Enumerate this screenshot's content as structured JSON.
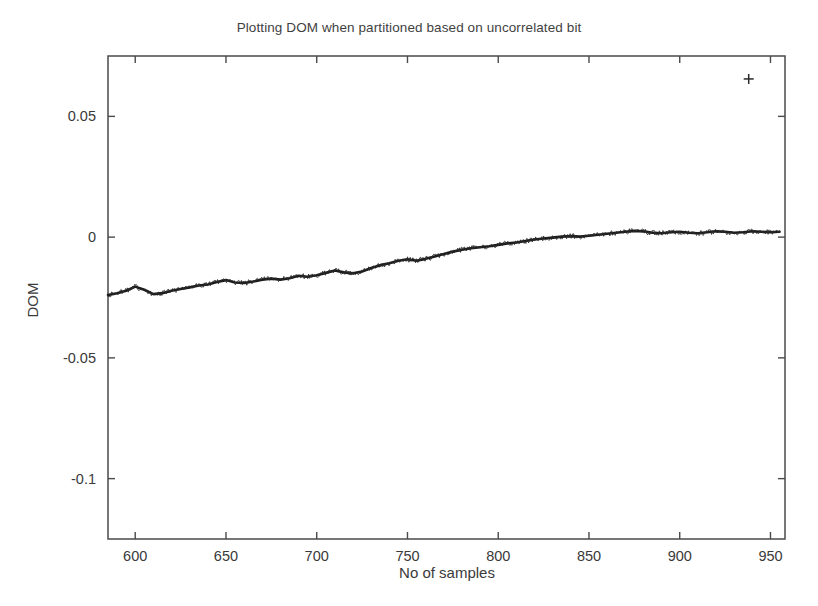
{
  "chart_data": {
    "type": "line",
    "title": "Plotting DOM when partitioned based on uncorrelated bit",
    "xlabel": "No of samples",
    "ylabel": "DOM",
    "xlim": [
      585,
      958
    ],
    "ylim": [
      -0.125,
      0.075
    ],
    "xticks": [
      600,
      650,
      700,
      750,
      800,
      850,
      900,
      950
    ],
    "xtick_labels": [
      "600",
      "650",
      "700",
      "750",
      "800",
      "850",
      "900",
      "950"
    ],
    "yticks": [
      0.05,
      0,
      -0.05,
      -0.1
    ],
    "ytick_labels": [
      "0.05",
      "0",
      "-0.05",
      "-0.1"
    ],
    "grid": false,
    "legend": null,
    "series": [
      {
        "name": "DOM",
        "style": "noisy-line-with-plus-markers",
        "color": "#1c1c1c",
        "x": [
          585,
          590,
          595,
          600,
          605,
          610,
          615,
          620,
          625,
          630,
          635,
          640,
          645,
          650,
          655,
          660,
          665,
          670,
          675,
          680,
          685,
          690,
          695,
          700,
          705,
          710,
          715,
          720,
          725,
          730,
          735,
          740,
          745,
          750,
          755,
          760,
          765,
          770,
          775,
          780,
          785,
          790,
          795,
          800,
          805,
          810,
          815,
          820,
          825,
          830,
          835,
          840,
          845,
          850,
          855,
          860,
          865,
          870,
          875,
          880,
          885,
          890,
          895,
          900,
          905,
          910,
          915,
          920,
          925,
          930,
          935,
          940,
          945,
          950,
          955
        ],
        "y": [
          -0.024,
          -0.0232,
          -0.0222,
          -0.0205,
          -0.0218,
          -0.0236,
          -0.0232,
          -0.0222,
          -0.0215,
          -0.0208,
          -0.02,
          -0.0196,
          -0.0186,
          -0.0178,
          -0.0188,
          -0.019,
          -0.0184,
          -0.0176,
          -0.0172,
          -0.0176,
          -0.017,
          -0.016,
          -0.0164,
          -0.0158,
          -0.0148,
          -0.0138,
          -0.0146,
          -0.015,
          -0.0142,
          -0.0128,
          -0.0116,
          -0.0108,
          -0.0098,
          -0.0092,
          -0.0098,
          -0.009,
          -0.008,
          -0.007,
          -0.006,
          -0.0052,
          -0.0046,
          -0.0042,
          -0.0038,
          -0.0032,
          -0.0026,
          -0.0022,
          -0.0016,
          -0.001,
          -0.0006,
          -0.0002,
          0.0002,
          0.0004,
          0.0002,
          0.0006,
          0.001,
          0.0014,
          0.0018,
          0.0022,
          0.0026,
          0.0024,
          0.0018,
          0.0016,
          0.002,
          0.0022,
          0.0018,
          0.0016,
          0.002,
          0.0024,
          0.0022,
          0.0018,
          0.002,
          0.0024,
          0.0022,
          0.002,
          0.0022
        ]
      }
    ],
    "annotations": [
      {
        "name": "isolated-plus-marker",
        "marker": "+",
        "x": 938,
        "y": 0.0655
      }
    ]
  }
}
